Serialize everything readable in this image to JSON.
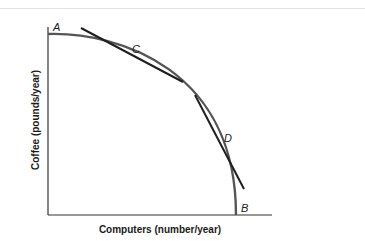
{
  "diagram": {
    "type": "production-possibilities-frontier",
    "x_axis_label": "Computers (number/year)",
    "y_axis_label": "Coffee (pounds/year)",
    "points": [
      {
        "id": "A",
        "label": "A"
      },
      {
        "id": "B",
        "label": "B"
      },
      {
        "id": "C",
        "label": "C"
      },
      {
        "id": "D",
        "label": "D"
      }
    ],
    "colors": {
      "curve": "#555555",
      "tangent": "#1f1f1f",
      "axis": "#333333"
    }
  }
}
